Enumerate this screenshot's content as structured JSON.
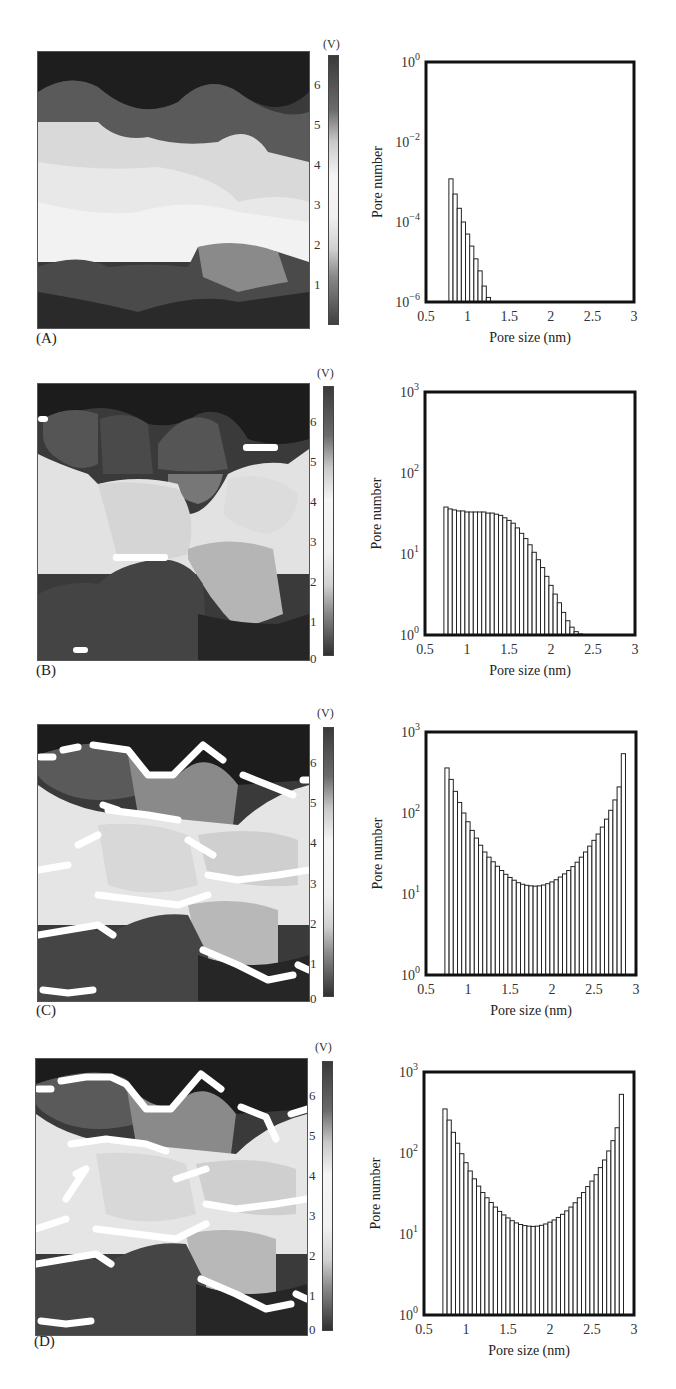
{
  "figure": {
    "panels": [
      {
        "label": "(A)",
        "colorbar_unit": "(V)",
        "colorbar_ticks": [
          "6",
          "5",
          "4",
          "3",
          "2",
          "1"
        ]
      },
      {
        "label": "(B)",
        "colorbar_unit": "(V)",
        "colorbar_ticks": [
          "6",
          "5",
          "4",
          "3",
          "2",
          "1",
          "0"
        ]
      },
      {
        "label": "(C)",
        "colorbar_unit": "(V)",
        "colorbar_ticks": [
          "6",
          "5",
          "4",
          "3",
          "2",
          "1",
          "0"
        ]
      },
      {
        "label": "(D)",
        "colorbar_unit": "(V)",
        "colorbar_ticks": [
          "6",
          "5",
          "4",
          "3",
          "2",
          "1",
          "0"
        ]
      }
    ]
  },
  "chart_data": [
    {
      "panel": "A",
      "type": "bar",
      "title": "",
      "xlabel": "Pore size (nm)",
      "ylabel": "Pore number",
      "yscale": "log",
      "xlim": [
        0.5,
        3
      ],
      "ylim": [
        1e-06,
        1
      ],
      "xticks": [
        "0.5",
        "1",
        "1.5",
        "2",
        "2.5",
        "3"
      ],
      "yticks": [
        {
          "base": "10",
          "exp": "−6"
        },
        {
          "base": "10",
          "exp": "−4"
        },
        {
          "base": "10",
          "exp": "−2"
        },
        {
          "base": "10",
          "exp": "0"
        }
      ],
      "grid": false,
      "bin_width": 0.05,
      "x": [
        0.8,
        0.85,
        0.9,
        0.95,
        1.0,
        1.05,
        1.1,
        1.15,
        1.2,
        1.25
      ],
      "values": [
        0.0012,
        0.0005,
        0.00022,
        0.0001,
        5e-05,
        2.5e-05,
        1.2e-05,
        6e-06,
        2.5e-06,
        1.3e-06
      ]
    },
    {
      "panel": "B",
      "type": "bar",
      "title": "",
      "xlabel": "Pore size (nm)",
      "ylabel": "Pore number",
      "yscale": "log",
      "xlim": [
        0.5,
        3
      ],
      "ylim": [
        1,
        1000
      ],
      "xticks": [
        "0.5",
        "1",
        "1.5",
        "2",
        "2.5",
        "3"
      ],
      "yticks": [
        {
          "base": "10",
          "exp": "0"
        },
        {
          "base": "10",
          "exp": "1"
        },
        {
          "base": "10",
          "exp": "2"
        },
        {
          "base": "10",
          "exp": "3"
        }
      ],
      "grid": false,
      "bin_width": 0.05,
      "x": [
        0.75,
        0.8,
        0.85,
        0.9,
        0.95,
        1.0,
        1.05,
        1.1,
        1.15,
        1.2,
        1.25,
        1.3,
        1.35,
        1.4,
        1.45,
        1.5,
        1.55,
        1.6,
        1.65,
        1.7,
        1.75,
        1.8,
        1.85,
        1.9,
        1.95,
        2.0,
        2.05,
        2.1,
        2.15,
        2.2,
        2.25,
        2.3,
        2.35
      ],
      "values": [
        38,
        36,
        35,
        34,
        34,
        33,
        33,
        33,
        33,
        33,
        32,
        32,
        31,
        30,
        28,
        26,
        24,
        21,
        18,
        15.5,
        13,
        10.5,
        8.5,
        6.8,
        5.3,
        4.1,
        3.2,
        2.5,
        1.9,
        1.5,
        1.25,
        1.1,
        1.03
      ]
    },
    {
      "panel": "C",
      "type": "bar",
      "title": "",
      "xlabel": "Pore size (nm)",
      "ylabel": "Pore number",
      "yscale": "log",
      "xlim": [
        0.5,
        3
      ],
      "ylim": [
        1,
        1000
      ],
      "xticks": [
        "0.5",
        "1",
        "1.5",
        "2",
        "2.5",
        "3"
      ],
      "yticks": [
        {
          "base": "10",
          "exp": "0"
        },
        {
          "base": "10",
          "exp": "1"
        },
        {
          "base": "10",
          "exp": "2"
        },
        {
          "base": "10",
          "exp": "3"
        }
      ],
      "grid": false,
      "bin_width": 0.05,
      "x": [
        0.75,
        0.8,
        0.85,
        0.9,
        0.95,
        1.0,
        1.05,
        1.1,
        1.15,
        1.2,
        1.25,
        1.3,
        1.35,
        1.4,
        1.45,
        1.5,
        1.55,
        1.6,
        1.65,
        1.7,
        1.75,
        1.8,
        1.85,
        1.9,
        1.95,
        2.0,
        2.05,
        2.1,
        2.15,
        2.2,
        2.25,
        2.3,
        2.35,
        2.4,
        2.45,
        2.5,
        2.55,
        2.6,
        2.65,
        2.7,
        2.75,
        2.8,
        2.85,
        2.9,
        2.95
      ],
      "values": [
        360,
        260,
        185,
        135,
        100,
        78,
        61,
        49,
        40,
        33,
        28.5,
        25,
        22,
        19.5,
        17.5,
        16,
        14.8,
        13.8,
        13.2,
        12.8,
        12.6,
        12.5,
        12.6,
        12.9,
        13.4,
        14.1,
        15,
        16.2,
        17.7,
        19.5,
        21.8,
        24.7,
        28.5,
        33,
        39,
        46,
        55,
        67,
        84,
        108,
        145,
        210,
        540
      ]
    },
    {
      "panel": "D",
      "type": "bar",
      "title": "",
      "xlabel": "Pore size (nm)",
      "ylabel": "Pore number",
      "yscale": "log",
      "xlim": [
        0.5,
        3
      ],
      "ylim": [
        1,
        1000
      ],
      "xticks": [
        "0.5",
        "1",
        "1.5",
        "2",
        "2.5",
        "3"
      ],
      "yticks": [
        {
          "base": "10",
          "exp": "0"
        },
        {
          "base": "10",
          "exp": "1"
        },
        {
          "base": "10",
          "exp": "2"
        },
        {
          "base": "10",
          "exp": "3"
        }
      ],
      "grid": false,
      "bin_width": 0.05,
      "x": [
        0.75,
        0.8,
        0.85,
        0.9,
        0.95,
        1.0,
        1.05,
        1.1,
        1.15,
        1.2,
        1.25,
        1.3,
        1.35,
        1.4,
        1.45,
        1.5,
        1.55,
        1.6,
        1.65,
        1.7,
        1.75,
        1.8,
        1.85,
        1.9,
        1.95,
        2.0,
        2.05,
        2.1,
        2.15,
        2.2,
        2.25,
        2.3,
        2.35,
        2.4,
        2.45,
        2.5,
        2.55,
        2.6,
        2.65,
        2.7,
        2.75,
        2.8,
        2.85,
        2.9,
        2.95
      ],
      "values": [
        350,
        255,
        180,
        132,
        98,
        76,
        60,
        48,
        39,
        32.5,
        28,
        24.5,
        21.5,
        19,
        17.2,
        15.8,
        14.6,
        13.7,
        13.1,
        12.7,
        12.5,
        12.4,
        12.5,
        12.8,
        13.3,
        14,
        14.9,
        16,
        17.5,
        19.3,
        21.5,
        24.3,
        28,
        32.5,
        38.5,
        45,
        54,
        66,
        82,
        106,
        142,
        205,
        530
      ]
    }
  ]
}
